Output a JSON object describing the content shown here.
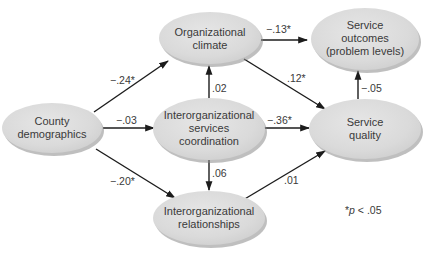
{
  "diagram": {
    "type": "path-model",
    "colors": {
      "node_fill": "#dcdcdc",
      "node_shadow": "#8a8a8a",
      "edge": "#1c1c1c",
      "text": "#3a3a3a",
      "background": "#ffffff"
    },
    "nodes": [
      {
        "id": "county",
        "lines": [
          "County",
          "demographics"
        ]
      },
      {
        "id": "climate",
        "lines": [
          "Organizational",
          "climate"
        ]
      },
      {
        "id": "outcomes",
        "lines": [
          "Service",
          "outcomes",
          "(problem levels)"
        ]
      },
      {
        "id": "coordination",
        "lines": [
          "Interorganizational",
          "services",
          "coordination"
        ]
      },
      {
        "id": "quality",
        "lines": [
          "Service",
          "quality"
        ]
      },
      {
        "id": "relationships",
        "lines": [
          "Interorganizational",
          "relationships"
        ]
      }
    ],
    "edges": [
      {
        "from": "county",
        "to": "climate",
        "label": "−.24*"
      },
      {
        "from": "county",
        "to": "coordination",
        "label": "−.03"
      },
      {
        "from": "county",
        "to": "relationships",
        "label": "−.20*"
      },
      {
        "from": "climate",
        "to": "outcomes",
        "label": "−.13*"
      },
      {
        "from": "climate",
        "to": "quality",
        "label": ".12*"
      },
      {
        "from": "coordination",
        "to": "climate",
        "label": ".02"
      },
      {
        "from": "coordination",
        "to": "quality",
        "label": "−.36*"
      },
      {
        "from": "coordination",
        "to": "relationships",
        "label": ".06"
      },
      {
        "from": "relationships",
        "to": "quality",
        "label": ".01"
      },
      {
        "from": "quality",
        "to": "outcomes",
        "label": "−.05"
      }
    ],
    "footnote": {
      "star": "*",
      "p": "p",
      "rest": " < .05"
    }
  }
}
